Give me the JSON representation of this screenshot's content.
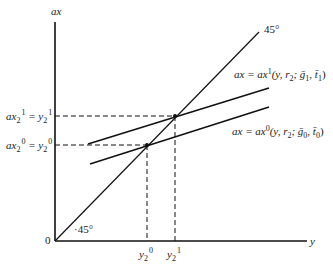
{
  "diagram": {
    "axes": {
      "y_axis_label": "ax",
      "x_axis_label": "y",
      "origin_label": "0"
    },
    "lines": [
      {
        "id": "45-degree",
        "label": "45°",
        "origin_label": "·45°"
      },
      {
        "id": "ax1",
        "label_lhs": "ax = ax",
        "label_sup": "1",
        "label_args": "(y, r",
        "label_sub": "2",
        "label_rest": "; ḡ",
        "label_g_sub": "1",
        "label_t": ", t̄",
        "label_t_sub": "1",
        "label_close": ")"
      },
      {
        "id": "ax0",
        "label_lhs": "ax = ax",
        "label_sup": "0",
        "label_args": "(y, r",
        "label_sub": "2",
        "label_rest": "; ḡ",
        "label_g_sub": "0",
        "label_t": ", t̄",
        "label_t_sub": "0",
        "label_close": ")"
      }
    ],
    "y_ticks": [
      {
        "id": "upper",
        "text_a": "ax",
        "sub_a": "2",
        "sup_a": "1",
        "eq": " = y",
        "sub_b": "2",
        "sup_b": "1"
      },
      {
        "id": "lower",
        "text_a": "ax",
        "sub_a": "2",
        "sup_a": "0",
        "eq": " = y",
        "sub_b": "2",
        "sup_b": "0"
      }
    ],
    "x_ticks": [
      {
        "id": "y20",
        "base": "y",
        "sub": "2",
        "sup": "0"
      },
      {
        "id": "y21",
        "base": "y",
        "sub": "2",
        "sup": "1"
      }
    ]
  }
}
